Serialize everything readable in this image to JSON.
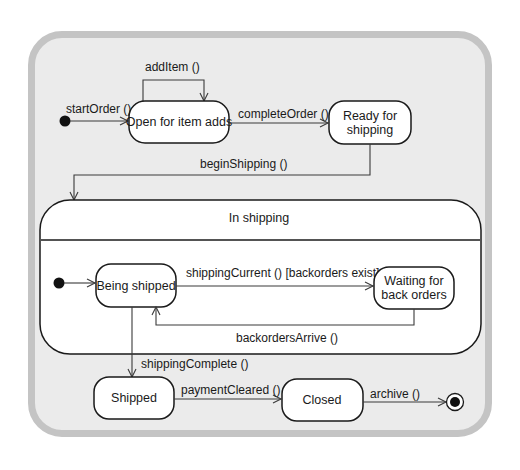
{
  "diagram": {
    "type": "UML state machine",
    "states": [
      {
        "id": "open",
        "label": "Open for item adds"
      },
      {
        "id": "ready",
        "label_line1": "Ready for",
        "label_line2": "shipping"
      },
      {
        "id": "in_shipping",
        "label": "In shipping",
        "composite": true
      },
      {
        "id": "being_shipped",
        "label": "Being shipped"
      },
      {
        "id": "waiting",
        "label_line1": "Waiting for",
        "label_line2": "back orders"
      },
      {
        "id": "shipped",
        "label": "Shipped"
      },
      {
        "id": "closed",
        "label": "Closed"
      }
    ],
    "transitions": [
      {
        "from": "initial",
        "to": "open",
        "label": "startOrder ()"
      },
      {
        "from": "open",
        "to": "open",
        "label": "addItem ()"
      },
      {
        "from": "open",
        "to": "ready",
        "label": "completeOrder ()"
      },
      {
        "from": "ready",
        "to": "in_shipping",
        "label": "beginShipping ()"
      },
      {
        "from": "inner_initial",
        "to": "being_shipped",
        "label": ""
      },
      {
        "from": "being_shipped",
        "to": "waiting",
        "label": "shippingCurrent () [backorders exist]"
      },
      {
        "from": "waiting",
        "to": "being_shipped",
        "label": "backordersArrive ()"
      },
      {
        "from": "being_shipped",
        "to": "shipped",
        "label": "shippingComplete ()"
      },
      {
        "from": "shipped",
        "to": "closed",
        "label": "paymentCleared ()"
      },
      {
        "from": "closed",
        "to": "final",
        "label": "archive ()"
      }
    ],
    "colors": {
      "frame_fill": "#ebebeb",
      "frame_border": "#c4c4c4",
      "state_fill": "#ffffff",
      "stroke": "#1a1a1a"
    }
  }
}
